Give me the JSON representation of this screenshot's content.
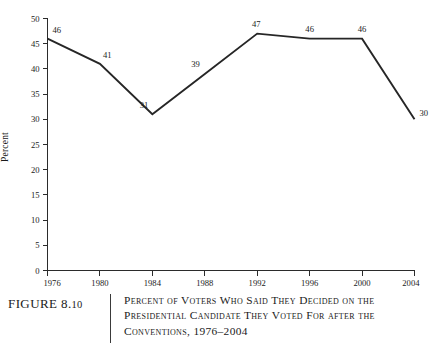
{
  "figure": {
    "number_prefix": "FIGURE ",
    "number": "8.",
    "number_small": "10",
    "caption": "Percent of Voters Who Said They Decided on the Presidential Candidate They Voted For after the Conventions, 1976–2004"
  },
  "chart_data": {
    "type": "line",
    "title": "Percent of Voters Who Said They Decided on the Presidential Candidate They Voted For after the Conventions, 1976–2004",
    "xlabel": "",
    "ylabel": "Percent",
    "categories": [
      "1976",
      "1980",
      "1984",
      "1988",
      "1992",
      "1996",
      "2000",
      "2004"
    ],
    "x": [
      1976,
      1980,
      1984,
      1988,
      1992,
      1996,
      2000,
      2004
    ],
    "values": [
      46,
      41,
      31,
      39,
      47,
      46,
      46,
      30
    ],
    "point_labels": [
      "46",
      "41",
      "31",
      "39",
      "47",
      "46",
      "46",
      "30"
    ],
    "ylim": [
      0,
      50
    ],
    "ytick_values": [
      0,
      5,
      10,
      15,
      20,
      25,
      30,
      35,
      40,
      45,
      50
    ],
    "ytick_labels": [
      "0",
      "5",
      "10",
      "15",
      "20",
      "25",
      "30",
      "35",
      "40",
      "45",
      "50"
    ],
    "xtick_labels": [
      "1976",
      "1980",
      "1984",
      "1988",
      "1992",
      "1996",
      "2000",
      "2004"
    ],
    "grid": false,
    "legend": false,
    "legend_position": "none",
    "line_color": "#262626",
    "axis_color": "#2b2b2b",
    "background_color": "#ffffff"
  }
}
